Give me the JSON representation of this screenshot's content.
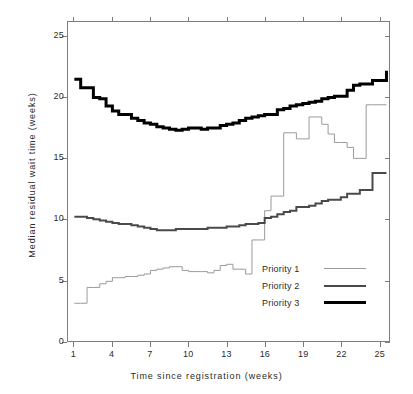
{
  "chart_data": {
    "type": "line",
    "title": "",
    "xlabel": "Time since registration (weeks)",
    "ylabel": "Median residual wait time (weeks)",
    "xlim": [
      0.5,
      25.8
    ],
    "ylim": [
      0,
      26.2
    ],
    "xticks": [
      1,
      4,
      7,
      10,
      13,
      16,
      19,
      22,
      25
    ],
    "yticks": [
      0,
      5,
      10,
      15,
      20,
      25
    ],
    "grid": false,
    "step": "post",
    "legend_position": "center-right",
    "series": [
      {
        "name": "Priority 1",
        "color": "#9a9a9a",
        "linewidth": 1,
        "x": [
          1,
          1.5,
          2,
          2.5,
          3,
          3.5,
          4,
          4.5,
          5,
          5.5,
          6,
          6.5,
          7,
          7.5,
          8,
          8.5,
          9,
          9.5,
          10,
          10.5,
          11,
          11.5,
          12,
          12.5,
          13,
          13.5,
          14,
          14.5,
          15,
          15.5,
          16,
          16.5,
          17,
          17.5,
          18,
          18.5,
          19,
          19.5,
          20,
          20.5,
          21,
          21.5,
          22,
          22.5,
          23,
          23.5,
          24,
          24.5,
          25,
          25.6
        ],
        "y": [
          3.1,
          3.1,
          4.4,
          4.4,
          4.7,
          4.9,
          5.2,
          5.2,
          5.3,
          5.3,
          5.4,
          5.5,
          5.8,
          5.9,
          6.0,
          6.1,
          6.1,
          5.8,
          5.7,
          5.7,
          5.7,
          5.6,
          5.8,
          6.2,
          6.3,
          5.9,
          5.9,
          5.5,
          8.3,
          8.3,
          10.7,
          11.9,
          11.9,
          17.1,
          17.1,
          16.6,
          16.6,
          18.4,
          18.4,
          17.8,
          17.0,
          16.3,
          16.3,
          15.9,
          15.0,
          15.0,
          19.4,
          19.4,
          19.4,
          19.4
        ]
      },
      {
        "name": "Priority 2",
        "color": "#4a4a4a",
        "linewidth": 2,
        "x": [
          1,
          1.5,
          2,
          2.5,
          3,
          3.5,
          4,
          4.5,
          5,
          5.5,
          6,
          6.5,
          7,
          7.5,
          8,
          8.5,
          9,
          9.5,
          10,
          10.5,
          11,
          11.5,
          12,
          12.5,
          13,
          13.5,
          14,
          14.5,
          15,
          15.5,
          16,
          16.5,
          17,
          17.5,
          18,
          18.5,
          19,
          19.5,
          20,
          20.5,
          21,
          21.5,
          22,
          22.5,
          23,
          23.5,
          24,
          24.5,
          25,
          25.6
        ],
        "y": [
          10.2,
          10.2,
          10.1,
          10.0,
          9.9,
          9.8,
          9.7,
          9.6,
          9.6,
          9.5,
          9.4,
          9.3,
          9.2,
          9.1,
          9.1,
          9.1,
          9.2,
          9.2,
          9.2,
          9.2,
          9.2,
          9.3,
          9.3,
          9.3,
          9.4,
          9.4,
          9.5,
          9.6,
          9.6,
          9.7,
          10.1,
          10.2,
          10.4,
          10.6,
          10.7,
          11.0,
          11.0,
          11.1,
          11.3,
          11.5,
          11.6,
          11.6,
          11.8,
          12.1,
          12.1,
          12.4,
          12.4,
          13.8,
          13.8,
          13.8
        ]
      },
      {
        "name": "Priority 3",
        "color": "#000000",
        "linewidth": 3,
        "x": [
          1,
          1.5,
          2,
          2.5,
          3,
          3.5,
          4,
          4.5,
          5,
          5.5,
          6,
          6.5,
          7,
          7.5,
          8,
          8.5,
          9,
          9.5,
          10,
          10.5,
          11,
          11.5,
          12,
          12.5,
          13,
          13.5,
          14,
          14.5,
          15,
          15.5,
          16,
          16.5,
          17,
          17.5,
          18,
          18.5,
          19,
          19.5,
          20,
          20.5,
          21,
          21.5,
          22,
          22.5,
          23,
          23.5,
          24,
          24.5,
          25,
          25.6
        ],
        "y": [
          21.5,
          20.8,
          20.8,
          20.0,
          19.9,
          19.3,
          18.9,
          18.6,
          18.6,
          18.3,
          18.1,
          17.9,
          17.8,
          17.6,
          17.5,
          17.4,
          17.3,
          17.4,
          17.5,
          17.5,
          17.4,
          17.5,
          17.5,
          17.7,
          17.8,
          17.9,
          18.1,
          18.3,
          18.4,
          18.5,
          18.6,
          18.6,
          19.0,
          19.1,
          19.3,
          19.4,
          19.5,
          19.6,
          19.7,
          19.9,
          20.0,
          20.1,
          20.1,
          20.6,
          21.0,
          21.1,
          21.1,
          21.4,
          21.4,
          22.2
        ]
      }
    ]
  },
  "axes": {
    "xlabel": "Time since registration (weeks)",
    "ylabel": "Median residual wait time (weeks)",
    "xtick_labels": [
      "1",
      "4",
      "7",
      "10",
      "13",
      "16",
      "19",
      "22",
      "25"
    ],
    "ytick_labels": [
      "0",
      "5",
      "10",
      "15",
      "20",
      "25"
    ]
  },
  "legend": {
    "items": [
      {
        "label": "Priority 1"
      },
      {
        "label": "Priority 2"
      },
      {
        "label": "Priority 3"
      }
    ]
  },
  "colors": {
    "priority1": "#9a9a9a",
    "priority2": "#4a4a4a",
    "priority3": "#000000",
    "frame": "#7c7c7c",
    "background": "#ffffff"
  }
}
